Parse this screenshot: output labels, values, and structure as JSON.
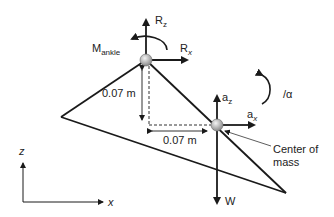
{
  "labels": {
    "r_z": "R",
    "r_z_sub": "z",
    "r_x": "R",
    "r_x_sub": "x",
    "m_ankle": "M",
    "m_ankle_sub": "ankle",
    "a_z": "a",
    "a_z_sub": "z",
    "a_x": "a",
    "a_x_sub": "x",
    "weight": "W",
    "alpha": "/α",
    "dist_vertical": "0.07 m",
    "dist_horizontal": "0.07 m",
    "com_line1": "Center of",
    "com_line2": "mass",
    "axis_z": "z",
    "axis_x": "x"
  },
  "colors": {
    "line": "#1a1a1a",
    "joint": "#9a9a9a"
  }
}
